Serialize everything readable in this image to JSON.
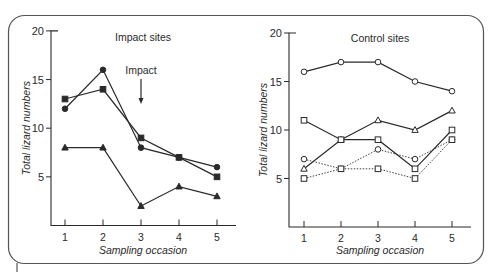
{
  "chart_data": [
    {
      "type": "line",
      "title": "Impact sites",
      "xlabel": "Sampling occasion",
      "ylabel": "Total lizard numbers",
      "x": [
        1,
        2,
        3,
        4,
        5
      ],
      "xticks": [
        "1",
        "2",
        "3",
        "4",
        "5"
      ],
      "yticks": [
        "5",
        "10",
        "15",
        "20"
      ],
      "ylim": [
        0,
        20
      ],
      "grid": false,
      "legend": "none",
      "annotations": [
        {
          "text": "Impact",
          "x": 3,
          "type": "down-arrow"
        }
      ],
      "series": [
        {
          "name": "site-filled-circle",
          "marker": "circle",
          "filled": true,
          "dash": "solid",
          "values": [
            12,
            16,
            8,
            7,
            6
          ]
        },
        {
          "name": "site-filled-square",
          "marker": "square",
          "filled": true,
          "dash": "solid",
          "values": [
            13,
            14,
            9,
            7,
            5
          ]
        },
        {
          "name": "site-filled-triangle",
          "marker": "triangle",
          "filled": true,
          "dash": "solid",
          "values": [
            8,
            8,
            2,
            4,
            3
          ]
        }
      ]
    },
    {
      "type": "line",
      "title": "Control sites",
      "xlabel": "Sampling occasion",
      "ylabel": "Total lizard numbers",
      "x": [
        1,
        2,
        3,
        4,
        5
      ],
      "xticks": [
        "1",
        "2",
        "3",
        "4",
        "5"
      ],
      "yticks": [
        "5",
        "10",
        "15",
        "20"
      ],
      "ylim": [
        0,
        20
      ],
      "grid": false,
      "legend": "none",
      "series": [
        {
          "name": "site-open-circle-solid",
          "marker": "circle",
          "filled": false,
          "dash": "solid",
          "values": [
            16,
            17,
            17,
            15,
            14
          ]
        },
        {
          "name": "site-open-triangle-solid",
          "marker": "triangle",
          "filled": false,
          "dash": "solid",
          "values": [
            6,
            9,
            11,
            10,
            12
          ]
        },
        {
          "name": "site-open-square-solid",
          "marker": "square",
          "filled": false,
          "dash": "solid",
          "values": [
            11,
            9,
            9,
            6,
            10
          ]
        },
        {
          "name": "site-open-circle-dotted",
          "marker": "circle",
          "filled": false,
          "dash": "dotted",
          "values": [
            7,
            6,
            8,
            7,
            9
          ]
        },
        {
          "name": "site-open-square-dotted",
          "marker": "square",
          "filled": false,
          "dash": "dotted",
          "values": [
            5,
            6,
            6,
            5,
            9
          ]
        }
      ]
    }
  ],
  "colors": {
    "ink": "#2a2a2a",
    "frame": "#555555",
    "background": "#ffffff"
  }
}
